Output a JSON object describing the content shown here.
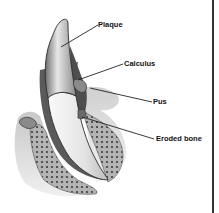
{
  "diagram": {
    "labels": [
      {
        "id": "plaque",
        "text": "Plaque",
        "x": 98,
        "y": 21,
        "pointer": {
          "x1": 98,
          "y1": 25,
          "x2": 61,
          "y2": 47
        }
      },
      {
        "id": "calculus",
        "text": "Calculus",
        "x": 124,
        "y": 60,
        "pointer": {
          "x1": 123,
          "y1": 64,
          "x2": 78,
          "y2": 80
        }
      },
      {
        "id": "pus",
        "text": "Pus",
        "x": 153,
        "y": 98,
        "pointer": {
          "x1": 152,
          "y1": 102,
          "x2": 90,
          "y2": 88
        }
      },
      {
        "id": "eroded-bone",
        "text": "Eroded bone",
        "x": 156,
        "y": 135,
        "pointer": {
          "x1": 154,
          "y1": 139,
          "x2": 82,
          "y2": 117
        }
      }
    ],
    "colors": {
      "background": "#ffffff",
      "line": "#222222",
      "enamel": "#d8d8d8",
      "root": "#f2f2f2",
      "gum": "#bdbdbd",
      "bone": "#a8a8a8",
      "bone_dots": "#444444",
      "frame": "#333333"
    }
  }
}
